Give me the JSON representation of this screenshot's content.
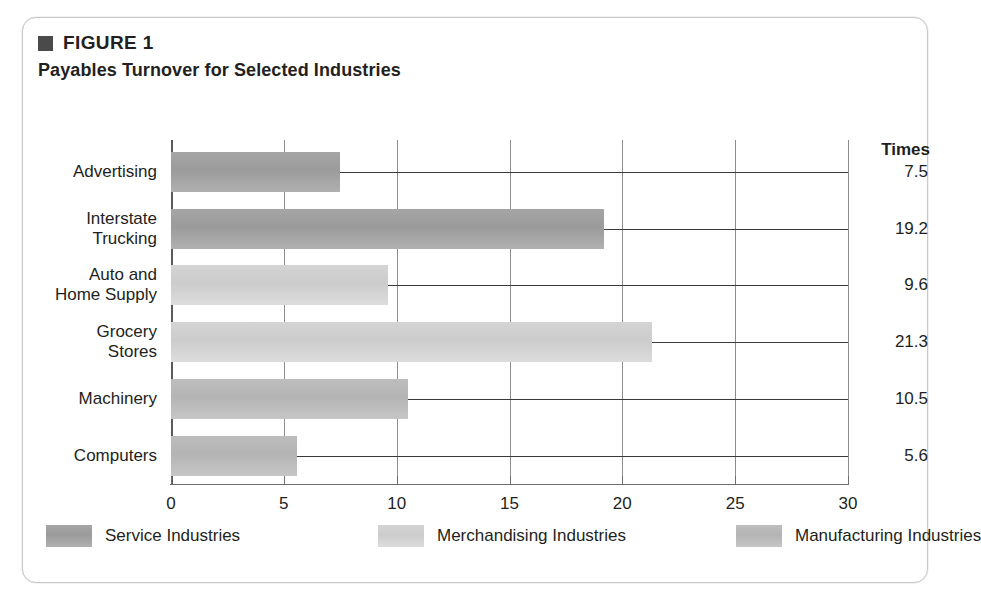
{
  "figure": {
    "label": "FIGURE 1",
    "title": "Payables Turnover for Selected Industries",
    "bullet_color": "#4a4a4a"
  },
  "chart_data": {
    "type": "bar",
    "orientation": "horizontal",
    "title": "Payables Turnover for Selected Industries",
    "xlabel": "",
    "ylabel": "",
    "value_axis_header": "Times",
    "categories": [
      "Advertising",
      "Interstate\nTrucking",
      "Auto and\nHome Supply",
      "Grocery\nStores",
      "Machinery",
      "Computers"
    ],
    "values": [
      7.5,
      19.2,
      9.6,
      21.3,
      10.5,
      5.6
    ],
    "value_labels": [
      "7.5",
      "19.2",
      "9.6",
      "21.3",
      "10.5",
      "5.6"
    ],
    "groups": [
      "Service Industries",
      "Service Industries",
      "Merchandising Industries",
      "Merchandising Industries",
      "Manufacturing Industries",
      "Manufacturing Industries"
    ],
    "xlim": [
      0,
      30
    ],
    "xticks": [
      0,
      5,
      10,
      15,
      20,
      25,
      30
    ],
    "xtick_labels": [
      "0",
      "5",
      "10",
      "15",
      "20",
      "25",
      "30"
    ],
    "grid": true,
    "legend_position": "bottom",
    "series": [
      {
        "name": "Service Industries",
        "color": "#9b9b9b"
      },
      {
        "name": "Merchandising Industries",
        "color": "#cccccc"
      },
      {
        "name": "Manufacturing Industries",
        "color": "#b4b4b4"
      }
    ]
  },
  "legend": {
    "items": [
      {
        "label": "Service Industries",
        "swatch_class": "service"
      },
      {
        "label": "Merchandising Industries",
        "swatch_class": "merch"
      },
      {
        "label": "Manufacturing Industries",
        "swatch_class": "manuf"
      }
    ]
  }
}
